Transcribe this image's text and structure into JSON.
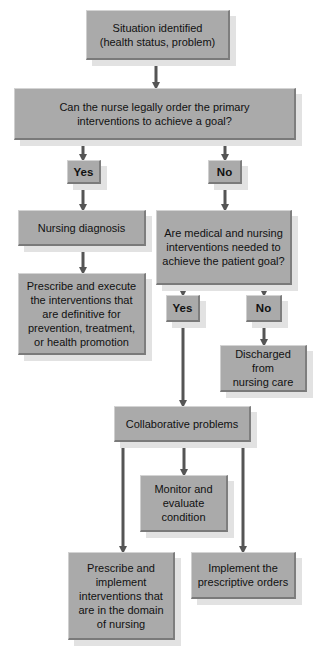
{
  "nodes": {
    "situation": "Situation identified\n(health status, problem)",
    "legal_question": "Can the nurse legally order the primary\ninterventions to achieve a goal?",
    "yes1": "Yes",
    "no1": "No",
    "nursing_diagnosis": "Nursing diagnosis",
    "medical_question": "Are medical and nursing\ninterventions needed to\nachieve the patient goal?",
    "prescribe_execute": "Prescribe and execute\nthe interventions that\nare definitive for\nprevention, treatment,\nor health promotion",
    "yes2": "Yes",
    "no2": "No",
    "discharged": "Discharged from\nnursing care",
    "collaborative": "Collaborative problems",
    "monitor": "Monitor and\nevaluate\ncondition",
    "prescribe_implement": "Prescribe and\nimplement\ninterventions that\nare in the domain\nof nursing",
    "implement_orders": "Implement the\nprescriptive orders"
  },
  "colors": {
    "box_fill": "#aaaaaa",
    "arrow": "#555555",
    "shadow": "#e2e2e2"
  }
}
